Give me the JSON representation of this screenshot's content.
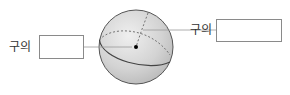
{
  "diagram": {
    "type": "sphere-parts",
    "left_label": {
      "text": "구의",
      "answer_box": ""
    },
    "right_label": {
      "text": "구의",
      "answer_box": ""
    },
    "colors": {
      "sphere_fill": "#c9c9c9",
      "sphere_highlight": "#eeeeee",
      "outline": "#555555",
      "leader_line": "#9a9a9a",
      "box_border": "#8a8a8a",
      "center_dot": "#000000"
    }
  }
}
